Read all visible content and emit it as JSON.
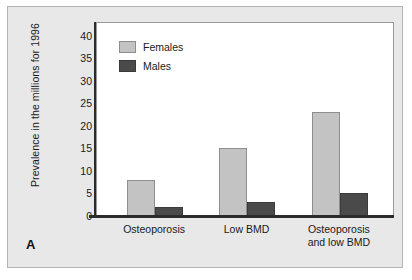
{
  "figure": {
    "panel_label": "A",
    "colors": {
      "background": "#e8e8e8",
      "plot_background": "#ffffff",
      "females": "#c3c3c3",
      "males": "#4a4a4a",
      "axis": "#2b2b2b"
    }
  },
  "chart_data": {
    "type": "bar",
    "title": "",
    "xlabel": "",
    "ylabel": "Prevalence in the millions for 1996",
    "categories": [
      "Osteoporosis",
      "Low BMD",
      "Osteoporosis and low BMD"
    ],
    "category_lines": [
      [
        "Osteoporosis"
      ],
      [
        "Low BMD"
      ],
      [
        "Osteoporosis",
        "and low BMD"
      ]
    ],
    "series": [
      {
        "name": "Females",
        "values": [
          8,
          15,
          23
        ],
        "color": "#c3c3c3"
      },
      {
        "name": "Males",
        "values": [
          2,
          3,
          5
        ],
        "color": "#4a4a4a"
      }
    ],
    "ylim": [
      0,
      43
    ],
    "yticks": [
      0,
      5,
      10,
      15,
      20,
      25,
      30,
      35,
      40
    ],
    "ytick_labels": [
      "0",
      "5",
      "10",
      "15",
      "20",
      "25",
      "30",
      "35",
      "40"
    ],
    "grid": false,
    "legend_position": "top-left"
  }
}
